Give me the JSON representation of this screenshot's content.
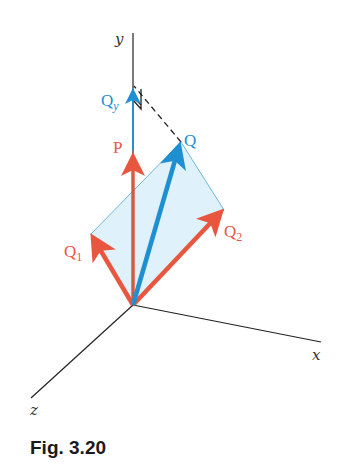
{
  "figure": {
    "caption": "Fig. 3.20",
    "colors": {
      "red_vector": "#e8563f",
      "blue_vector": "#1e8fd0",
      "parallelogram_fill": "#d9eef9",
      "parallelogram_edge": "#6fb6e0",
      "axis": "#222222"
    },
    "axes": {
      "x": "x",
      "y": "y",
      "z": "z"
    },
    "vectors": {
      "P": {
        "label": "P",
        "color": "red"
      },
      "Q": {
        "label": "Q",
        "color": "blue"
      },
      "Q1": {
        "label": "Q",
        "subscript": "1",
        "color": "red"
      },
      "Q2": {
        "label": "Q",
        "subscript": "2",
        "color": "red"
      },
      "Qy": {
        "label": "Q",
        "subscript": "y",
        "color": "blue"
      }
    }
  }
}
